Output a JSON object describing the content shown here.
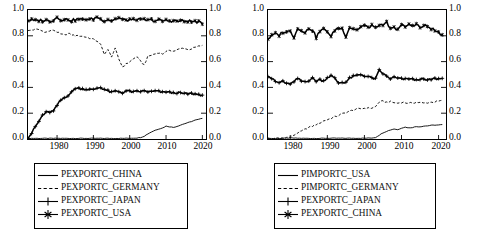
{
  "figure": {
    "panels": [
      {
        "id": "left",
        "yaxis": {
          "ticks": [
            "0.0",
            "0.2",
            "0.4",
            "0.6",
            "0.8",
            "1.0"
          ],
          "min": 0.0,
          "max": 1.0
        },
        "xaxis": {
          "ticks": [
            "1980",
            "1990",
            "2000",
            "2010",
            "2020"
          ],
          "min": 1972,
          "max": 2021
        },
        "legend": [
          {
            "label": "PEXPORTC_CHINA",
            "key": "solid-line"
          },
          {
            "label": "PEXPORTC_GERMANY",
            "key": "dashed-line"
          },
          {
            "label": "PEXPORTC_JAPAN",
            "key": "plus-marker-line"
          },
          {
            "label": "PEXPORTC_USA",
            "key": "star-marker-line"
          }
        ]
      },
      {
        "id": "right",
        "yaxis": {
          "ticks": [
            "0.0",
            "0.2",
            "0.4",
            "0.6",
            "0.8",
            "1.0"
          ],
          "min": 0.0,
          "max": 1.0
        },
        "xaxis": {
          "ticks": [
            "1980",
            "1990",
            "2000",
            "2010",
            "2020"
          ],
          "min": 1974,
          "max": 2022
        },
        "legend": [
          {
            "label": "PIMPORTC_USA",
            "key": "solid-line"
          },
          {
            "label": "PIMPORTC_GERMANY",
            "key": "dashed-line"
          },
          {
            "label": "PEXPORTC_JAPAN",
            "key": "plus-marker-line"
          },
          {
            "label": "PEXPORTC_CHINA",
            "key": "star-marker-line"
          }
        ]
      }
    ]
  },
  "chart_data": [
    {
      "type": "line",
      "title": "",
      "xlabel": "",
      "ylabel": "",
      "xlim": [
        1972,
        2021
      ],
      "ylim": [
        0.0,
        1.0
      ],
      "grid": false,
      "legend_position": "below-axes",
      "xticks": [
        1980,
        1990,
        2000,
        2010,
        2020
      ],
      "yticks": [
        0.0,
        0.2,
        0.4,
        0.6,
        0.8,
        1.0
      ],
      "series": [
        {
          "name": "PEXPORTC_CHINA",
          "style": "solid",
          "x": [
            1972,
            1974,
            1976,
            1978,
            1980,
            1982,
            1984,
            1986,
            1988,
            1990,
            1992,
            1994,
            1996,
            1998,
            2000,
            2002,
            2003,
            2004,
            2005,
            2006,
            2007,
            2008,
            2009,
            2010,
            2011,
            2012,
            2013,
            2014,
            2015,
            2016,
            2017,
            2018,
            2019,
            2020
          ],
          "values": [
            0.005,
            0.005,
            0.005,
            0.005,
            0.005,
            0.005,
            0.005,
            0.005,
            0.005,
            0.005,
            0.005,
            0.005,
            0.005,
            0.005,
            0.006,
            0.008,
            0.012,
            0.022,
            0.04,
            0.055,
            0.068,
            0.078,
            0.085,
            0.1,
            0.095,
            0.09,
            0.098,
            0.108,
            0.118,
            0.126,
            0.136,
            0.146,
            0.152,
            0.16
          ]
        },
        {
          "name": "PEXPORTC_GERMANY",
          "style": "dashed",
          "x": [
            1972,
            1973,
            1974,
            1975,
            1976,
            1977,
            1978,
            1979,
            1980,
            1981,
            1982,
            1983,
            1984,
            1985,
            1986,
            1987,
            1988,
            1989,
            1990,
            1991,
            1992,
            1993,
            1994,
            1995,
            1996,
            1997,
            1998,
            2002,
            2003,
            2004,
            2005,
            2006,
            2007,
            2008,
            2009,
            2010,
            2011,
            2012,
            2013,
            2014,
            2015,
            2016,
            2017,
            2018,
            2019,
            2020
          ],
          "values": [
            0.838,
            0.845,
            0.85,
            0.848,
            0.836,
            0.828,
            0.838,
            0.845,
            0.83,
            0.812,
            0.806,
            0.818,
            0.808,
            0.8,
            0.8,
            0.796,
            0.79,
            0.782,
            0.772,
            0.76,
            0.73,
            0.66,
            0.69,
            0.64,
            0.7,
            0.62,
            0.56,
            0.64,
            0.6,
            0.575,
            0.64,
            0.65,
            0.66,
            0.67,
            0.66,
            0.675,
            0.69,
            0.68,
            0.69,
            0.7,
            0.705,
            0.692,
            0.7,
            0.71,
            0.718,
            0.726
          ]
        },
        {
          "name": "PEXPORTC_JAPAN",
          "style": "plus",
          "x": [
            1972,
            1973,
            1974,
            1975,
            1976,
            1977,
            1978,
            1979,
            1980,
            1981,
            1982,
            1983,
            1984,
            1985,
            1990,
            1991,
            1992,
            1993,
            1994,
            1995,
            1996,
            1997,
            1998,
            1999,
            2000,
            2001,
            2002,
            2003,
            2004,
            2005,
            2006,
            2007,
            2008,
            2009,
            2010,
            2011,
            2012,
            2013,
            2014,
            2015,
            2016,
            2017,
            2018,
            2019,
            2020
          ],
          "values": [
            0.01,
            0.045,
            0.095,
            0.135,
            0.185,
            0.205,
            0.21,
            0.215,
            0.26,
            0.3,
            0.32,
            0.34,
            0.36,
            0.395,
            0.38,
            0.395,
            0.4,
            0.385,
            0.372,
            0.36,
            0.37,
            0.368,
            0.36,
            0.37,
            0.372,
            0.362,
            0.368,
            0.37,
            0.372,
            0.368,
            0.365,
            0.372,
            0.368,
            0.36,
            0.368,
            0.36,
            0.355,
            0.36,
            0.355,
            0.352,
            0.35,
            0.352,
            0.348,
            0.345,
            0.34
          ]
        },
        {
          "name": "PEXPORTC_USA",
          "style": "star",
          "x": [
            1972,
            1973,
            1974,
            1975,
            1976,
            1977,
            1978,
            1979,
            1980,
            1981,
            1982,
            1983,
            1984,
            1985,
            1986,
            1987,
            1988,
            1989,
            1990,
            1991,
            1992,
            1993,
            1994,
            1995,
            1996,
            1997,
            1998,
            1999,
            2000,
            2001,
            2002,
            2003,
            2004,
            2005,
            2006,
            2007,
            2008,
            2009,
            2010,
            2011,
            2012,
            2013,
            2014,
            2015,
            2016,
            2017,
            2018,
            2019,
            2020
          ],
          "values": [
            0.918,
            0.922,
            0.916,
            0.92,
            0.918,
            0.92,
            0.916,
            0.922,
            0.945,
            0.928,
            0.922,
            0.93,
            0.918,
            0.924,
            0.93,
            0.922,
            0.932,
            0.926,
            0.93,
            0.948,
            0.928,
            0.92,
            0.928,
            0.918,
            0.93,
            0.94,
            0.926,
            0.918,
            0.928,
            0.922,
            0.93,
            0.92,
            0.926,
            0.918,
            0.924,
            0.916,
            0.922,
            0.914,
            0.92,
            0.916,
            0.918,
            0.912,
            0.918,
            0.91,
            0.916,
            0.908,
            0.912,
            0.906,
            0.89
          ]
        }
      ]
    },
    {
      "type": "line",
      "title": "",
      "xlabel": "",
      "ylabel": "",
      "xlim": [
        1974,
        2022
      ],
      "ylim": [
        0.0,
        1.0
      ],
      "grid": false,
      "legend_position": "below-axes",
      "xticks": [
        1980,
        1990,
        2000,
        2010,
        2020
      ],
      "yticks": [
        0.0,
        0.2,
        0.4,
        0.6,
        0.8,
        1.0
      ],
      "series": [
        {
          "name": "PIMPORTC_USA",
          "style": "solid",
          "x": [
            1974,
            1976,
            1978,
            1980,
            1982,
            1984,
            1986,
            1988,
            1990,
            1992,
            1994,
            1996,
            1998,
            2000,
            2002,
            2003,
            2004,
            2005,
            2006,
            2007,
            2008,
            2009,
            2010,
            2011,
            2012,
            2013,
            2014,
            2015,
            2016,
            2017,
            2018,
            2019,
            2020,
            2021
          ],
          "values": [
            0.004,
            0.004,
            0.005,
            0.008,
            0.006,
            0.005,
            0.005,
            0.005,
            0.006,
            0.006,
            0.006,
            0.006,
            0.006,
            0.006,
            0.008,
            0.012,
            0.03,
            0.048,
            0.06,
            0.07,
            0.078,
            0.072,
            0.085,
            0.092,
            0.086,
            0.09,
            0.096,
            0.095,
            0.1,
            0.102,
            0.106,
            0.108,
            0.108,
            0.112
          ]
        },
        {
          "name": "PIMPORTC_GERMANY",
          "style": "dashed",
          "x": [
            1974,
            1976,
            1978,
            1980,
            1981,
            1982,
            1983,
            1984,
            1985,
            1986,
            1987,
            1988,
            1989,
            1990,
            1991,
            1992,
            1993,
            1994,
            1995,
            1996,
            1997,
            1998,
            2000,
            2002,
            2003,
            2004,
            2005,
            2006,
            2007,
            2008,
            2009,
            2010,
            2011,
            2012,
            2013,
            2014,
            2015,
            2016,
            2017,
            2018,
            2019,
            2020,
            2021
          ],
          "values": [
            0.004,
            0.005,
            0.008,
            0.015,
            0.03,
            0.048,
            0.06,
            0.075,
            0.09,
            0.1,
            0.112,
            0.125,
            0.14,
            0.15,
            0.16,
            0.172,
            0.182,
            0.195,
            0.205,
            0.215,
            0.225,
            0.232,
            0.238,
            0.24,
            0.25,
            0.288,
            0.292,
            0.285,
            0.288,
            0.282,
            0.278,
            0.285,
            0.282,
            0.276,
            0.28,
            0.285,
            0.282,
            0.278,
            0.282,
            0.285,
            0.288,
            0.292,
            0.3
          ]
        },
        {
          "name": "PEXPORTC_JAPAN",
          "style": "plus",
          "x": [
            1974,
            1975,
            1976,
            1977,
            1978,
            1979,
            1980,
            1981,
            1982,
            1983,
            1984,
            1985,
            1986,
            1987,
            1988,
            1989,
            1990,
            1991,
            1992,
            1993,
            1994,
            1995,
            1996,
            1997,
            1998,
            1999,
            2003,
            2004,
            2005,
            2006,
            2007,
            2008,
            2009,
            2010,
            2011,
            2012,
            2013,
            2014,
            2015,
            2016,
            2017,
            2018,
            2019,
            2020,
            2021
          ],
          "values": [
            0.49,
            0.47,
            0.445,
            0.435,
            0.45,
            0.425,
            0.43,
            0.44,
            0.47,
            0.448,
            0.445,
            0.455,
            0.47,
            0.45,
            0.46,
            0.45,
            0.478,
            0.49,
            0.47,
            0.435,
            0.44,
            0.44,
            0.47,
            0.485,
            0.492,
            0.5,
            0.465,
            0.532,
            0.508,
            0.485,
            0.468,
            0.478,
            0.47,
            0.465,
            0.462,
            0.47,
            0.462,
            0.455,
            0.468,
            0.46,
            0.455,
            0.462,
            0.468,
            0.466,
            0.47
          ]
        },
        {
          "name": "PEXPORTC_CHINA",
          "style": "star",
          "x": [
            1974,
            1975,
            1976,
            1977,
            1978,
            1979,
            1980,
            1981,
            1982,
            1983,
            1984,
            1985,
            1986,
            1987,
            1988,
            1989,
            1990,
            1991,
            1992,
            1993,
            1994,
            1995,
            1996,
            1997,
            1998,
            1999,
            2000,
            2001,
            2002,
            2003,
            2004,
            2005,
            2006,
            2007,
            2008,
            2009,
            2010,
            2011,
            2012,
            2013,
            2014,
            2015,
            2016,
            2017,
            2018,
            2019,
            2020,
            2021
          ],
          "values": [
            0.775,
            0.8,
            0.815,
            0.805,
            0.83,
            0.825,
            0.845,
            0.79,
            0.855,
            0.85,
            0.82,
            0.86,
            0.845,
            0.79,
            0.835,
            0.85,
            0.838,
            0.79,
            0.845,
            0.86,
            0.855,
            0.8,
            0.865,
            0.858,
            0.845,
            0.87,
            0.88,
            0.862,
            0.885,
            0.855,
            0.89,
            0.87,
            0.905,
            0.85,
            0.862,
            0.855,
            0.88,
            0.87,
            0.885,
            0.88,
            0.895,
            0.86,
            0.878,
            0.872,
            0.858,
            0.84,
            0.825,
            0.808
          ]
        }
      ]
    }
  ]
}
